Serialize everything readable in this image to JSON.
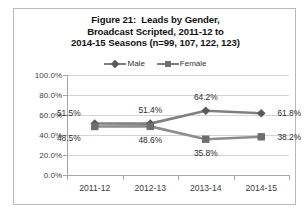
{
  "figure": {
    "title_lines": [
      "Figure 21:  Leads by Gender,",
      "Broadcast Scripted, 2011-12 to",
      "2014-15 Seasons (n=99, 107, 122, 123)"
    ]
  },
  "colors": {
    "male_line": "#808080",
    "male_marker": "#595959",
    "female_line": "#8c8c8c",
    "female_marker": "#6e6e6e",
    "gridline": "#d3d3d3",
    "axis": "#a6a6a6",
    "frame": "#b9b9b9",
    "text": "#3d3d3d",
    "background": "#ffffff"
  },
  "chart_data": {
    "type": "line",
    "title": "Figure 21:  Leads by Gender, Broadcast Scripted, 2011-12 to 2014-15 Seasons (n=99, 107, 122, 123)",
    "xlabel": "",
    "ylabel": "",
    "categories": [
      "2011-12",
      "2012-13",
      "2013-14",
      "2014-15"
    ],
    "series": [
      {
        "name": "Male",
        "marker": "diamond",
        "values": [
          51.5,
          51.4,
          64.2,
          61.8
        ],
        "labels": [
          "51.5%",
          "51.4%",
          "64.2%",
          "61.8%"
        ],
        "label_positions": [
          "left-above",
          "above",
          "above",
          "right"
        ]
      },
      {
        "name": "Female",
        "marker": "square",
        "values": [
          48.5,
          48.6,
          35.8,
          38.2
        ],
        "labels": [
          "48.5%",
          "48.6%",
          "35.8%",
          "38.2%"
        ],
        "label_positions": [
          "left-below",
          "below",
          "below",
          "right"
        ]
      }
    ],
    "ylim": [
      0,
      100
    ],
    "ytick_values": [
      0,
      20,
      40,
      60,
      80,
      100
    ],
    "ytick_labels": [
      "0.0%",
      "20.0%",
      "40.0%",
      "60.0%",
      "80.0%",
      "100.0%"
    ],
    "grid": true,
    "legend_position": "top"
  }
}
